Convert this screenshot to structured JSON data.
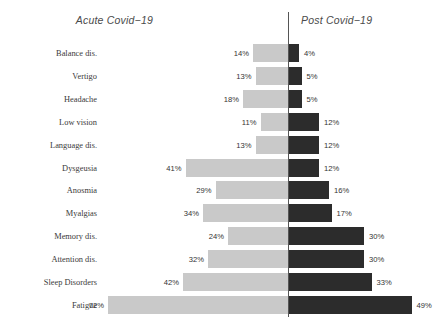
{
  "headers": {
    "left": "Acute Covid−19",
    "right": "Post Covid−19"
  },
  "style": {
    "left_bar_color": "#c9c9c9",
    "right_bar_color": "#2c2c2c",
    "axis_color": "#555555",
    "background": "#ffffff",
    "label_color": "#3a3a3a"
  },
  "chart_data": {
    "type": "bar",
    "subtype": "butterfly-diverging-horizontal",
    "title": "",
    "subtitle": "",
    "xlabel": "",
    "ylabel": "",
    "grid": false,
    "legend_position": "top",
    "axis_center_value": 0,
    "xlim": [
      0,
      75
    ],
    "units": "%",
    "categories": [
      "Balance dis.",
      "Vertigo",
      "Headache",
      "Low vision",
      "Language dis.",
      "Dysgeusia",
      "Anosmia",
      "Myalgias",
      "Memory dis.",
      "Attention dis.",
      "Sleep Disorders",
      "Fatigue"
    ],
    "series": [
      {
        "name": "Acute Covid−19",
        "side": "left",
        "color": "#c9c9c9",
        "values": [
          14,
          13,
          18,
          11,
          13,
          41,
          29,
          34,
          24,
          32,
          42,
          72
        ],
        "labels": [
          "14%",
          "13%",
          "18%",
          "11%",
          "13%",
          "41%",
          "29%",
          "34%",
          "24%",
          "32%",
          "42%",
          "72%"
        ]
      },
      {
        "name": "Post Covid−19",
        "side": "right",
        "color": "#2c2c2c",
        "values": [
          4,
          5,
          5,
          12,
          12,
          12,
          16,
          17,
          30,
          30,
          33,
          49
        ],
        "labels": [
          "4%",
          "5%",
          "5%",
          "12%",
          "12%",
          "12%",
          "16%",
          "17%",
          "30%",
          "30%",
          "33%",
          "49%"
        ]
      }
    ]
  }
}
